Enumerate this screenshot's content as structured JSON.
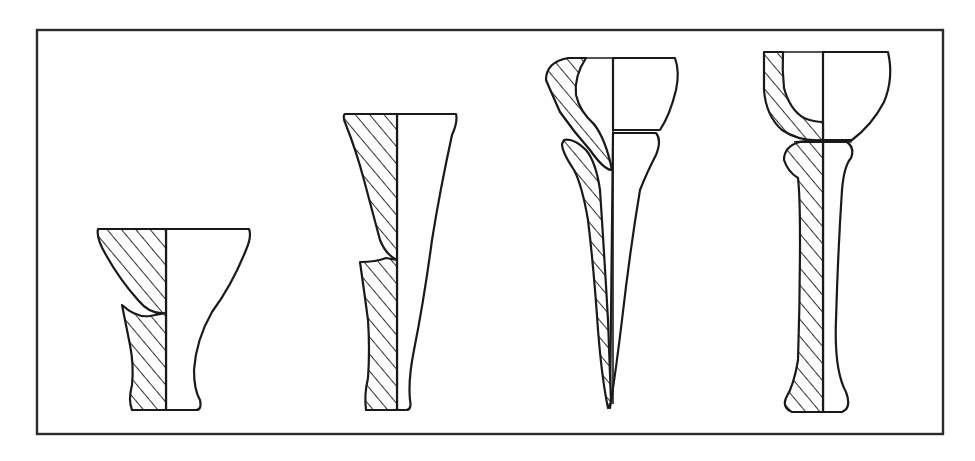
{
  "figure": {
    "type": "archaeological vessel profile drawings",
    "frame_color": "#2a2a2a",
    "line_color": "#1a1a1a",
    "background": "#ffffff",
    "hatch": "diagonal section hatching on left half",
    "vessels": [
      {
        "id": 1,
        "shape": "flared cup / short pedestal beaker"
      },
      {
        "id": 2,
        "shape": "tall flared beaker"
      },
      {
        "id": 3,
        "shape": "bowl on conical pointed stem (two joined parts)"
      },
      {
        "id": 4,
        "shape": "hemispherical bowl on tall stem (two joined parts)"
      }
    ]
  }
}
